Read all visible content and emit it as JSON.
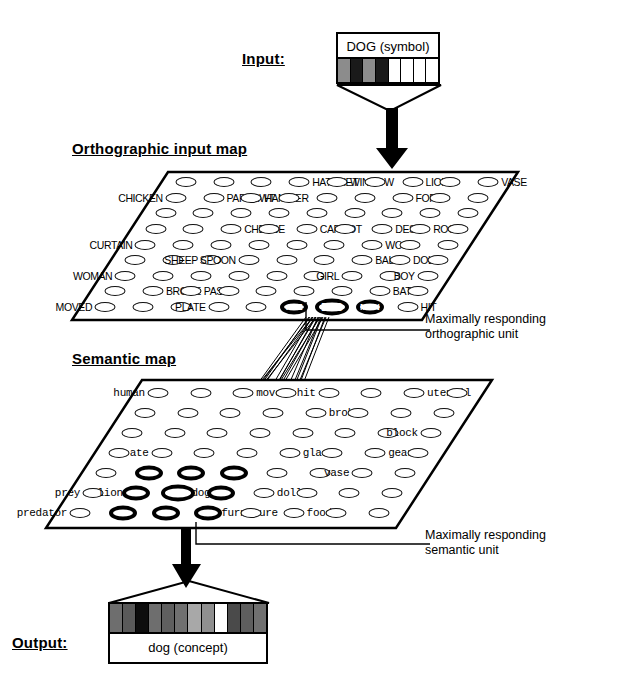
{
  "figure": {
    "type": "diagram"
  },
  "titles": {
    "input": "Input:",
    "orthographic_map": "Orthographic input map",
    "semantic_map": "Semantic map",
    "output": "Output:"
  },
  "input_box": {
    "caption": "DOG (symbol)",
    "cell_count": 8,
    "cells": [
      "#8c8c8c",
      "#1a1a1a",
      "#8c8c8c",
      "#1a1a1a",
      "#ffffff",
      "#ffffff",
      "#ffffff",
      "#ffffff"
    ]
  },
  "output_box": {
    "caption": "dog  (concept)",
    "cell_count": 12,
    "cells": [
      "#6e6e6e",
      "#5a5a5a",
      "#0d0d0d",
      "#6e6e6e",
      "#5f5f5f",
      "#707070",
      "#a8a8a8",
      "#8f8f8f",
      "#ffffff",
      "#4a4a4a",
      "#5e5e5e",
      "#707070"
    ]
  },
  "orthographic_map": {
    "rows": 7,
    "cols": 9,
    "labels": [
      {
        "row": 0,
        "col": 1,
        "text": "",
        "side": "right"
      },
      {
        "row": 0,
        "col": 3,
        "text": "HATCHET",
        "side": "right"
      },
      {
        "row": 0,
        "col": 4,
        "text": "WINDOW",
        "side": "right"
      },
      {
        "row": 0,
        "col": 6,
        "text": "LION",
        "side": "right"
      },
      {
        "row": 0,
        "col": 8,
        "text": "VASE",
        "side": "right"
      },
      {
        "row": 1,
        "col": 0,
        "text": "CHICKEN",
        "side": "left"
      },
      {
        "row": 1,
        "col": 1,
        "text": "PAPERWT",
        "side": "right"
      },
      {
        "row": 1,
        "col": 2,
        "text": "HAMMER",
        "side": "right"
      },
      {
        "row": 1,
        "col": 6,
        "text": "FORK",
        "side": "right"
      },
      {
        "row": 3,
        "col": 2,
        "text": "CHEESE",
        "side": "right"
      },
      {
        "row": 3,
        "col": 4,
        "text": "CARROT",
        "side": "right"
      },
      {
        "row": 3,
        "col": 6,
        "text": "DESK",
        "side": "right"
      },
      {
        "row": 3,
        "col": 7,
        "text": "ROCK",
        "side": "right"
      },
      {
        "row": 4,
        "col": 0,
        "text": "CURTAIN",
        "side": "left"
      },
      {
        "row": 4,
        "col": 6,
        "text": "WOLF",
        "side": "right"
      },
      {
        "row": 5,
        "col": 2,
        "text": "SHEEP",
        "side": "left"
      },
      {
        "row": 5,
        "col": 3,
        "text": "SPOON",
        "side": "left"
      },
      {
        "row": 5,
        "col": 6,
        "text": "BALL",
        "side": "right"
      },
      {
        "row": 5,
        "col": 7,
        "text": "DOLL",
        "side": "right"
      },
      {
        "row": 6,
        "col": 0,
        "text": "WOMAN",
        "side": "left"
      },
      {
        "row": 6,
        "col": 6,
        "text": "GIRL",
        "side": "left"
      },
      {
        "row": 6,
        "col": 8,
        "text": "BOY",
        "side": "left"
      },
      {
        "row": 7,
        "col": 1,
        "text": "BROKE",
        "side": "right"
      },
      {
        "row": 7,
        "col": 2,
        "text": "PASTA",
        "side": "right"
      },
      {
        "row": 7,
        "col": 7,
        "text": "BAT",
        "side": "right"
      },
      {
        "row": 8,
        "col": 0,
        "text": "MOVED",
        "side": "left"
      },
      {
        "row": 8,
        "col": 3,
        "text": "PLATE",
        "side": "left"
      },
      {
        "row": 8,
        "col": 8,
        "text": "HIT",
        "side": "right"
      }
    ],
    "highlighted_units": [
      "ATE",
      "DOG",
      "MAN"
    ],
    "winner_unit": "DOG"
  },
  "semantic_map": {
    "rows": 6,
    "cols": 8,
    "labels": [
      {
        "text": "human"
      },
      {
        "text": "moved"
      },
      {
        "text": "hit"
      },
      {
        "text": "utensil"
      },
      {
        "text": "broke"
      },
      {
        "text": "block"
      },
      {
        "text": "ate"
      },
      {
        "text": "glass"
      },
      {
        "text": "gear"
      },
      {
        "text": "vase"
      },
      {
        "text": "prey"
      },
      {
        "text": "lion"
      },
      {
        "text": "dog"
      },
      {
        "text": "doll"
      },
      {
        "text": "predator"
      },
      {
        "text": "furniture"
      },
      {
        "text": "food"
      }
    ],
    "highlighted_count": 9,
    "winner_unit": "dog"
  },
  "annotations": {
    "orthographic": [
      "Maximally responding",
      "orthographic unit"
    ],
    "semantic": [
      "Maximally responding",
      "semantic unit"
    ]
  },
  "colors": {
    "ink": "#000000",
    "paper": "#ffffff",
    "plane_edge": "#000000"
  }
}
